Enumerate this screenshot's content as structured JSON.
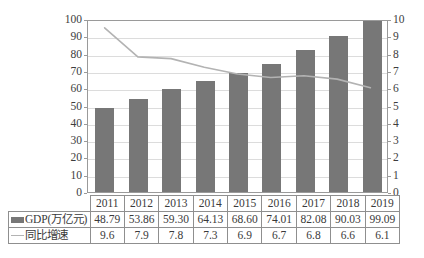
{
  "chart_data": {
    "type": "bar",
    "title": "",
    "subtitle": "",
    "xlabel": "",
    "ylabel": "",
    "categories": [
      "2011",
      "2012",
      "2013",
      "2014",
      "2015",
      "2016",
      "2017",
      "2018",
      "2019"
    ],
    "series": [
      {
        "name": "GDP(万亿元)",
        "type": "bar",
        "axis": "left",
        "values": [
          48.79,
          53.86,
          59.3,
          64.13,
          68.6,
          74.01,
          82.08,
          90.03,
          99.09
        ],
        "display_values": [
          "48.79",
          "53.86",
          "59.30",
          "64.13",
          "68.60",
          "74.01",
          "82.08",
          "90.03",
          "99.09"
        ],
        "color": "#777777"
      },
      {
        "name": "同比增速",
        "type": "line",
        "axis": "right",
        "values": [
          9.6,
          7.9,
          7.8,
          7.3,
          6.9,
          6.7,
          6.8,
          6.6,
          6.1
        ],
        "display_values": [
          "9.6",
          "7.9",
          "7.8",
          "7.3",
          "6.9",
          "6.7",
          "6.8",
          "6.6",
          "6.1"
        ],
        "color": "#b3b3b3"
      }
    ],
    "left_axis": {
      "ylim": [
        0,
        100
      ],
      "ticks": [
        0,
        10,
        20,
        30,
        40,
        50,
        60,
        70,
        80,
        90,
        100
      ],
      "tick_labels": [
        "0",
        "10",
        "20",
        "30",
        "40",
        "50",
        "60",
        "70",
        "80",
        "90",
        "100"
      ]
    },
    "right_axis": {
      "ylim": [
        0,
        10
      ],
      "ticks": [
        0,
        1,
        2,
        3,
        4,
        5,
        6,
        7,
        8,
        9,
        10
      ],
      "tick_labels": [
        "0",
        "1",
        "2",
        "3",
        "4",
        "5",
        "6",
        "7",
        "8",
        "9",
        "10"
      ]
    },
    "grid": true,
    "legend_position": "data-table-left-column"
  },
  "table": {
    "header_row": [
      "2011",
      "2012",
      "2013",
      "2014",
      "2015",
      "2016",
      "2017",
      "2018",
      "2019"
    ],
    "rows": [
      {
        "legend_label": "GDP(万亿元)",
        "legend_marker": "bar-swatch-icon",
        "values": [
          "48.79",
          "53.86",
          "59.30",
          "64.13",
          "68.60",
          "74.01",
          "82.08",
          "90.03",
          "99.09"
        ]
      },
      {
        "legend_label": "同比增速",
        "legend_marker": "line-swatch-icon",
        "values": [
          "9.6",
          "7.9",
          "7.8",
          "7.3",
          "6.9",
          "6.7",
          "6.8",
          "6.6",
          "6.1"
        ]
      }
    ]
  },
  "caption": "",
  "colors": {
    "bar": "#777777",
    "line": "#b3b3b3",
    "grid": "#dcdcdc",
    "axis": "#9a9a9a",
    "text": "#3a3a3a",
    "background": "#ffffff"
  }
}
